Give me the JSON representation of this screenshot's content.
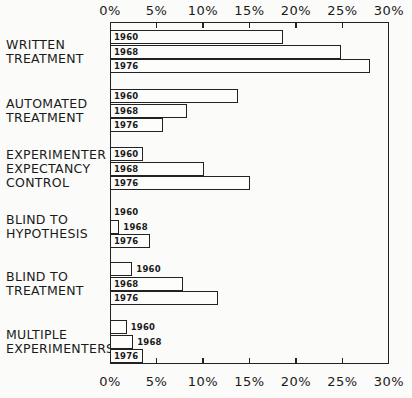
{
  "chart_data": {
    "type": "bar",
    "orientation": "horizontal",
    "title": "",
    "xlabel": "",
    "ylabel": "",
    "xlim": [
      0,
      30
    ],
    "x_ticks": [
      "0%",
      "5%",
      "10%",
      "15%",
      "20%",
      "25%",
      "30%"
    ],
    "x_tick_values": [
      0,
      5,
      10,
      15,
      20,
      25,
      30
    ],
    "grid": false,
    "legend": "none (year labels inside bars)",
    "categories": [
      "WRITTEN\nTREATMENT",
      "AUTOMATED\nTREATMENT",
      "EXPERIMENTER\nEXPECTANCY\nCONTROL",
      "BLIND TO\nHYPOTHESIS",
      "BLIND TO\nTREATMENT",
      "MULTIPLE\nEXPERIMENTERS"
    ],
    "series": [
      {
        "name": "1960",
        "values": [
          18.6,
          13.8,
          3.5,
          0.0,
          2.4,
          1.8
        ]
      },
      {
        "name": "1968",
        "values": [
          24.8,
          8.3,
          10.1,
          1.0,
          7.8,
          2.5
        ]
      },
      {
        "name": "1976",
        "values": [
          28.0,
          5.7,
          15.1,
          4.3,
          11.6,
          3.5
        ]
      }
    ]
  }
}
